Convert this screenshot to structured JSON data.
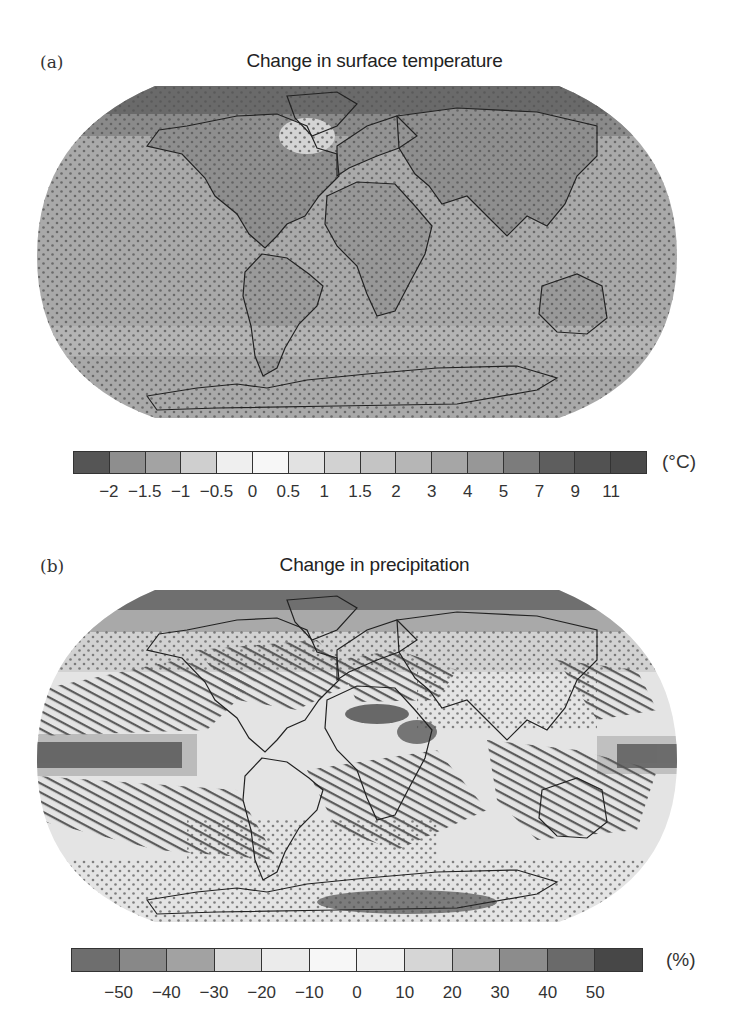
{
  "panels": [
    {
      "label": "(a)",
      "title": "Change in surface temperature",
      "colorbar": {
        "unit": "(°C)",
        "ticks": [
          "−2",
          "−1.5",
          "−1",
          "−0.5",
          "0",
          "0.5",
          "1",
          "1.5",
          "2",
          "3",
          "4",
          "5",
          "7",
          "9",
          "11"
        ],
        "colors": [
          "#555555",
          "#8e8e8e",
          "#a3a3a3",
          "#cfcfcf",
          "#efefef",
          "#f7f7f7",
          "#e2e2e2",
          "#d2d2d2",
          "#c4c4c4",
          "#b6b6b6",
          "#a6a6a6",
          "#979797",
          "#7c7c7c",
          "#5e5e5e",
          "#525252",
          "#4a4a4a"
        ]
      },
      "map": {
        "ocean_base": "#a8a8a8",
        "stippling": "dots",
        "notes": "Warming everywhere; strongest over land and Arctic; stippled globally"
      }
    },
    {
      "label": "(b)",
      "title": "Change in precipitation",
      "colorbar": {
        "unit": "(%)",
        "ticks": [
          "−50",
          "−40",
          "−30",
          "−20",
          "−10",
          "0",
          "10",
          "20",
          "30",
          "40",
          "50"
        ],
        "colors": [
          "#6e6e6e",
          "#888888",
          "#a2a2a2",
          "#dadada",
          "#ebebeb",
          "#f7f7f7",
          "#f1f1f1",
          "#d6d6d6",
          "#b4b4b4",
          "#8c8c8c",
          "#6a6a6a",
          "#474747"
        ]
      },
      "map": {
        "ocean_base": "#e6e6e6",
        "stippling": "dots",
        "hatching": "diagonal lines",
        "notes": "Increases at high latitudes and equatorial Pacific; decreases in subtropics (hatched)"
      }
    }
  ],
  "chart_data": [
    {
      "type": "heatmap",
      "title": "Change in surface temperature",
      "panel": "(a)",
      "projection": "Robinson (world)",
      "colorbar_unit": "°C",
      "colorbar_ticks": [
        -2,
        -1.5,
        -1,
        -0.5,
        0,
        0.5,
        1,
        1.5,
        2,
        3,
        4,
        5,
        7,
        9,
        11
      ],
      "colorbar_bins": 16,
      "legend_position": "bottom"
    },
    {
      "type": "heatmap",
      "title": "Change in precipitation",
      "panel": "(b)",
      "projection": "Robinson (world)",
      "colorbar_unit": "%",
      "colorbar_ticks": [
        -50,
        -40,
        -30,
        -20,
        -10,
        0,
        10,
        20,
        30,
        40,
        50
      ],
      "colorbar_bins": 12,
      "legend_position": "bottom"
    }
  ]
}
